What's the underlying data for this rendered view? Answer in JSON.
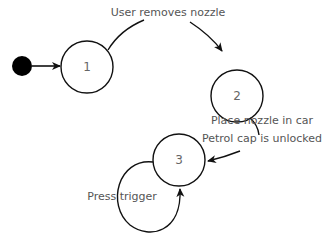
{
  "diagram": {
    "type": "state-machine",
    "start": {
      "cx": 22,
      "cy": 66,
      "r": 10
    },
    "states": [
      {
        "id": "1",
        "label": "1",
        "cx": 87,
        "cy": 67,
        "r": 26
      },
      {
        "id": "2",
        "label": "2",
        "cx": 237,
        "cy": 96,
        "r": 26
      },
      {
        "id": "3",
        "label": "3",
        "cx": 179,
        "cy": 160,
        "r": 26
      }
    ],
    "transitions": [
      {
        "from": "start",
        "to": "1",
        "label": ""
      },
      {
        "from": "1",
        "to": "2",
        "label": "User removes nozzle"
      },
      {
        "from": "2",
        "to": "3",
        "label_line1": "Place nozzle in car",
        "label_line2": "Petrol cap is unlocked"
      },
      {
        "from": "3",
        "to": "3",
        "label": "Press trigger"
      }
    ],
    "colors": {
      "stroke": "#111111",
      "text": "#555555",
      "background": "#ffffff"
    }
  }
}
